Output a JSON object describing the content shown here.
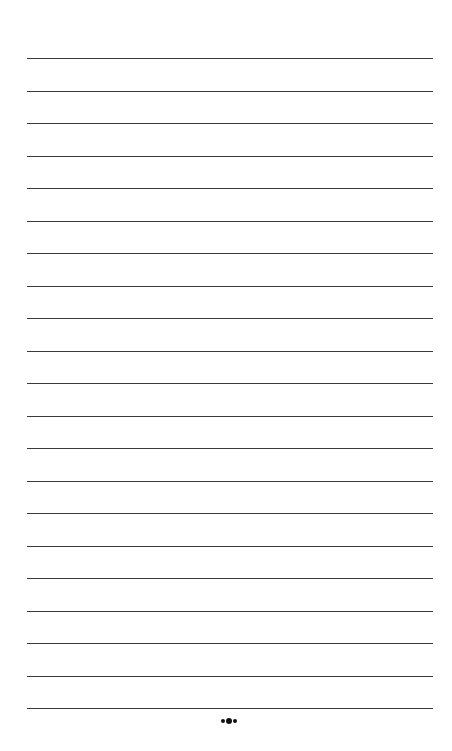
{
  "page": {
    "type": "lined-paper",
    "background": "#ffffff",
    "line_color": "#3a3a3a",
    "line_count": 21,
    "first_line_y": 58,
    "line_spacing": 32.5,
    "line_left": 27,
    "line_right": 433
  },
  "footer": {
    "ornament_icon": "three-dots-ornament"
  }
}
